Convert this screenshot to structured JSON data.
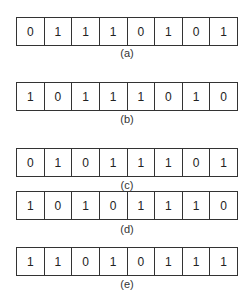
{
  "figure": {
    "rows": [
      {
        "label": "(a)",
        "bits": [
          "0",
          "1",
          "1",
          "1",
          "0",
          "1",
          "0",
          "1"
        ]
      },
      {
        "label": "(b)",
        "bits": [
          "1",
          "0",
          "1",
          "1",
          "1",
          "0",
          "1",
          "0"
        ]
      },
      {
        "label": "(c)",
        "bits": [
          "0",
          "1",
          "0",
          "1",
          "1",
          "1",
          "0",
          "1"
        ]
      },
      {
        "label": "(d)",
        "bits": [
          "1",
          "0",
          "1",
          "0",
          "1",
          "1",
          "1",
          "0"
        ]
      },
      {
        "label": "(e)",
        "bits": [
          "1",
          "1",
          "0",
          "1",
          "0",
          "1",
          "1",
          "1"
        ]
      }
    ]
  }
}
